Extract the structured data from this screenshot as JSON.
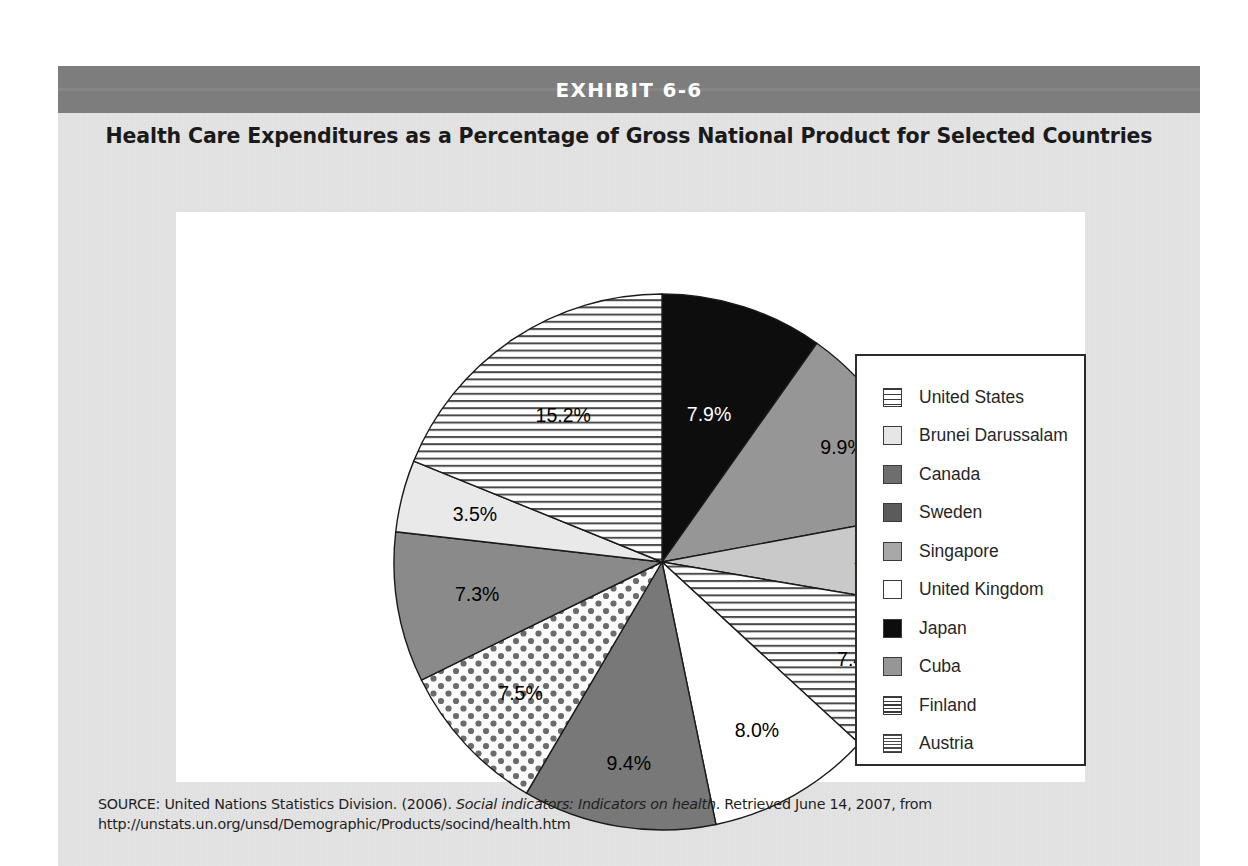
{
  "exhibit": {
    "label": "EXHIBIT 6-6",
    "band_color": "#7d7d7d",
    "page_color": "#e4e4e4"
  },
  "title": "Health Care Expenditures as a Percentage of Gross National Product for Selected Countries",
  "source": {
    "prefix": "SOURCE: United Nations Statistics Division. (2006). ",
    "italic": "Social indicators: Indicators on health",
    "suffix": ". Retrieved June 14, 2007, from http://unstats.un.org/unsd/Demographic/Products/socind/health.htm"
  },
  "legend": {
    "title": "",
    "items": [
      {
        "label": "United States",
        "swatch": "hstripe"
      },
      {
        "label": "Brunei Darussalam",
        "swatch": "verylight"
      },
      {
        "label": "Canada",
        "swatch": "gray-dark"
      },
      {
        "label": "Sweden",
        "swatch": "gray-darker"
      },
      {
        "label": "Singapore",
        "swatch": "gray-mid"
      },
      {
        "label": "United Kingdom",
        "swatch": "white"
      },
      {
        "label": "Japan",
        "swatch": "black"
      },
      {
        "label": "Cuba",
        "swatch": "gray-med"
      },
      {
        "label": "Finland",
        "swatch": "hstripe-tight"
      },
      {
        "label": "Austria",
        "swatch": "grid"
      }
    ]
  },
  "chart_data": {
    "type": "pie",
    "title": "Health Care Expenditures as a Percentage of Gross National Product for Selected Countries",
    "unit": "percent of GNP",
    "legend_position": "right",
    "start_angle_deg": 0,
    "direction": "clockwise",
    "total": 80.6,
    "categories": [
      "Japan",
      "Cuba",
      "Singapore",
      "Finland",
      "United Kingdom",
      "Sweden",
      "Austria",
      "Canada",
      "Brunei Darussalam",
      "United States"
    ],
    "values": [
      7.9,
      9.9,
      4.5,
      7.4,
      8.0,
      9.4,
      7.5,
      7.3,
      3.5,
      15.2
    ],
    "labels": [
      "7.9%",
      "9.9%",
      "4.5%",
      "7.4%",
      "8.0%",
      "9.4%",
      "7.5%",
      "7.3%",
      "3.5%",
      "15.2%"
    ],
    "slices": [
      {
        "name": "Japan",
        "value": 7.9,
        "label": "7.9%",
        "fill": "black",
        "label_color": "#ffffff"
      },
      {
        "name": "Cuba",
        "value": 9.9,
        "label": "9.9%",
        "fill": "gray-med",
        "label_color": "#000000"
      },
      {
        "name": "Singapore",
        "value": 4.5,
        "label": "4.5%",
        "fill": "gray-mid",
        "label_color": "#000000"
      },
      {
        "name": "Finland",
        "value": 7.4,
        "label": "7.4%",
        "fill": "hstripe-tight",
        "label_color": "#000000"
      },
      {
        "name": "United Kingdom",
        "value": 8.0,
        "label": "8.0%",
        "fill": "white",
        "label_color": "#000000"
      },
      {
        "name": "Sweden",
        "value": 9.4,
        "label": "9.4%",
        "fill": "gray-darker",
        "label_color": "#000000"
      },
      {
        "name": "Austria",
        "value": 7.5,
        "label": "7.5%",
        "fill": "dots",
        "label_color": "#000000"
      },
      {
        "name": "Canada",
        "value": 7.3,
        "label": "7.3%",
        "fill": "gray-dark",
        "label_color": "#000000"
      },
      {
        "name": "Brunei Darussalam",
        "value": 3.5,
        "label": "3.5%",
        "fill": "verylight",
        "label_color": "#000000"
      },
      {
        "name": "United States",
        "value": 15.2,
        "label": "15.2%",
        "fill": "hstripe",
        "label_color": "#000000"
      }
    ]
  }
}
